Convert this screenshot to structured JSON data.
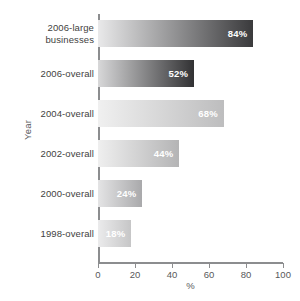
{
  "chart_data": {
    "type": "bar",
    "orientation": "horizontal",
    "title": "",
    "xlabel": "%",
    "ylabel": "Year",
    "xlim": [
      0,
      100
    ],
    "xticks": [
      0,
      20,
      40,
      60,
      80,
      100
    ],
    "grid": false,
    "legend": false,
    "categories": [
      "2006-large businesses",
      "2006-overall",
      "2004-overall",
      "2002-overall",
      "2000-overall",
      "1998-overall"
    ],
    "values": [
      84,
      52,
      68,
      44,
      24,
      18
    ],
    "data_labels": [
      "84%",
      "52%",
      "68%",
      "44%",
      "24%",
      "18%"
    ],
    "bars": [
      {
        "category": "2006-large businesses",
        "category_line1": "2006-large",
        "category_line2": "businesses",
        "value": 84,
        "label": "84%",
        "gradient_start": "#e9e9ea",
        "gradient_end": "#3a3a3c"
      },
      {
        "category": "2006-overall",
        "category_line1": "2006-overall",
        "category_line2": "",
        "value": 52,
        "label": "52%",
        "gradient_start": "#d8d8d9",
        "gradient_end": "#313133"
      },
      {
        "category": "2004-overall",
        "category_line1": "2004-overall",
        "category_line2": "",
        "value": 68,
        "label": "68%",
        "gradient_start": "#f0f0f0",
        "gradient_end": "#bdbdbe"
      },
      {
        "category": "2002-overall",
        "category_line1": "2002-overall",
        "category_line2": "",
        "value": 44,
        "label": "44%",
        "gradient_start": "#efefef",
        "gradient_end": "#b4b4b5"
      },
      {
        "category": "2000-overall",
        "category_line1": "2000-overall",
        "category_line2": "",
        "value": 24,
        "label": "24%",
        "gradient_start": "#e4e4e5",
        "gradient_end": "#a9a9ab"
      },
      {
        "category": "1998-overall",
        "category_line1": "1998-overall",
        "category_line2": "",
        "value": 18,
        "label": "18%",
        "gradient_start": "#ebebec",
        "gradient_end": "#c6c6c7"
      }
    ],
    "axis_color": "#8c8d8f",
    "label_color": "#3f3f41",
    "value_label_color": "#ffffff"
  }
}
